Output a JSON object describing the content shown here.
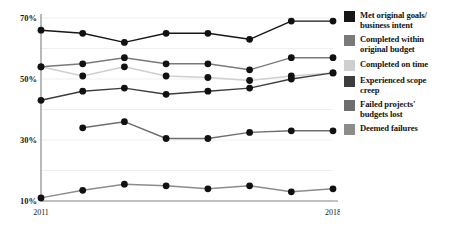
{
  "chart_data": {
    "type": "line",
    "title": "",
    "subtitle": "",
    "xlabel": "",
    "ylabel": "",
    "x": [
      2011,
      2012,
      2013,
      2014,
      2015,
      2016,
      2017,
      2018
    ],
    "xtick_labels_shown": [
      "2011",
      "2018"
    ],
    "xlim": [
      2011,
      2018
    ],
    "ylim": [
      10,
      70
    ],
    "ytick_labels": [
      "10%",
      "30%",
      "50%",
      "70%"
    ],
    "ytick_values": [
      10,
      30,
      50,
      70
    ],
    "grid": true,
    "grid_interval": 10,
    "legend_position": "right",
    "value_suffix": "%",
    "series": [
      {
        "name": "Met original goals/\nbusiness intent",
        "color": "#171717",
        "values": [
          66,
          65,
          62,
          65,
          65,
          63,
          69,
          69
        ]
      },
      {
        "name": "Completed within\noriginal budget",
        "color": "#7a7a7a",
        "values": [
          54,
          55,
          57,
          55,
          55,
          53,
          57,
          57
        ]
      },
      {
        "name": "Completed on time",
        "color": "#cfcfcf",
        "values": [
          54,
          51,
          54,
          51,
          50.5,
          49.5,
          51,
          52
        ]
      },
      {
        "name": "Experienced scope\ncreep",
        "color": "#3d3d3d",
        "values": [
          43,
          46,
          47,
          45,
          46,
          47,
          50,
          52
        ]
      },
      {
        "name": "Failed projects'\nbudgets lost",
        "color": "#6e6e6e",
        "values": [
          null,
          34,
          36,
          30.5,
          30.5,
          32.5,
          33,
          33
        ]
      },
      {
        "name": "Deemed failures",
        "color": "#8c8c8c",
        "values": [
          11,
          13.5,
          15.5,
          15,
          14,
          15,
          13,
          14
        ]
      }
    ]
  },
  "legend": {
    "items": [
      {
        "label": "Met original goals/\nbusiness intent",
        "swatch": "#171717"
      },
      {
        "label": "Completed within\noriginal budget",
        "swatch": "#7a7a7a"
      },
      {
        "label": "Completed on time",
        "swatch": "#cfcfcf"
      },
      {
        "label": "Experienced scope\ncreep",
        "swatch": "#3d3d3d"
      },
      {
        "label": "Failed projects'\nbudgets lost",
        "swatch": "#6e6e6e"
      },
      {
        "label": "Deemed failures",
        "swatch": "#8c8c8c"
      }
    ]
  }
}
